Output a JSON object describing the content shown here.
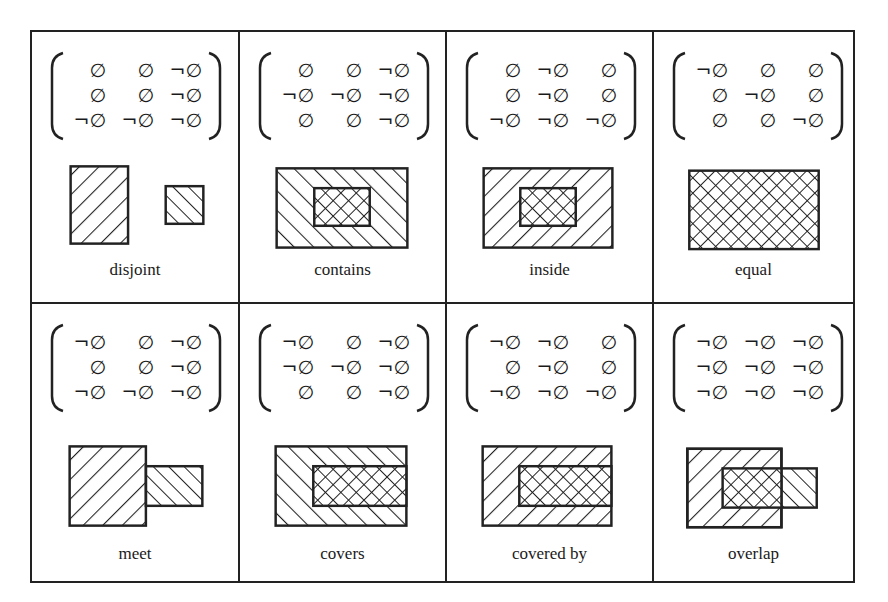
{
  "figure": {
    "fragment_text": "",
    "empty_symbol": "∅",
    "negation_symbol": "¬",
    "line_color": "#222222",
    "background": "#ffffff"
  },
  "relations": [
    {
      "name": "disjoint",
      "matrix": [
        [
          "∅",
          "∅",
          "¬∅"
        ],
        [
          "∅",
          "∅",
          "¬∅"
        ],
        [
          "¬∅",
          "¬∅",
          "¬∅"
        ]
      ],
      "picture": "disjoint"
    },
    {
      "name": "contains",
      "matrix": [
        [
          "∅",
          "∅",
          "¬∅"
        ],
        [
          "¬∅",
          "¬∅",
          "¬∅"
        ],
        [
          "∅",
          "∅",
          "¬∅"
        ]
      ],
      "picture": "contains"
    },
    {
      "name": "inside",
      "matrix": [
        [
          "∅",
          "¬∅",
          "∅"
        ],
        [
          "∅",
          "¬∅",
          "∅"
        ],
        [
          "¬∅",
          "¬∅",
          "¬∅"
        ]
      ],
      "picture": "inside"
    },
    {
      "name": "equal",
      "matrix": [
        [
          "¬∅",
          "∅",
          "∅"
        ],
        [
          "∅",
          "¬∅",
          "∅"
        ],
        [
          "∅",
          "∅",
          "¬∅"
        ]
      ],
      "picture": "equal"
    },
    {
      "name": "meet",
      "matrix": [
        [
          "¬∅",
          "∅",
          "¬∅"
        ],
        [
          "∅",
          "∅",
          "¬∅"
        ],
        [
          "¬∅",
          "¬∅",
          "¬∅"
        ]
      ],
      "picture": "meet"
    },
    {
      "name": "covers",
      "matrix": [
        [
          "¬∅",
          "∅",
          "¬∅"
        ],
        [
          "¬∅",
          "¬∅",
          "¬∅"
        ],
        [
          "∅",
          "∅",
          "¬∅"
        ]
      ],
      "picture": "covers"
    },
    {
      "name": "covered by",
      "matrix": [
        [
          "¬∅",
          "¬∅",
          "∅"
        ],
        [
          "∅",
          "¬∅",
          "∅"
        ],
        [
          "¬∅",
          "¬∅",
          "¬∅"
        ]
      ],
      "picture": "covered-by"
    },
    {
      "name": "overlap",
      "matrix": [
        [
          "¬∅",
          "¬∅",
          "¬∅"
        ],
        [
          "¬∅",
          "¬∅",
          "¬∅"
        ],
        [
          "¬∅",
          "¬∅",
          "¬∅"
        ]
      ],
      "picture": "overlap"
    }
  ]
}
